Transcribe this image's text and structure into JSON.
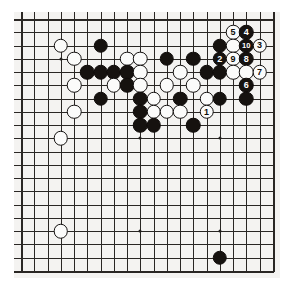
{
  "figure": {
    "kind": "go-board-diagram",
    "board_size_cols": 20,
    "board_size_rows": 20,
    "background_color": "#f4f3f1",
    "line_color": "#2a2724",
    "black_stone_color": "#16120f",
    "white_stone_color": "#fbfbfa"
  },
  "geometry": {
    "origin_x": 7,
    "origin_y": 7,
    "step": 13.25,
    "stone_diameter": 14.5,
    "label_font_size": 9
  },
  "star_points": [
    {
      "col": 3,
      "row": 3
    },
    {
      "col": 9,
      "row": 3
    },
    {
      "col": 15,
      "row": 3
    },
    {
      "col": 3,
      "row": 9
    },
    {
      "col": 9,
      "row": 9
    },
    {
      "col": 15,
      "row": 9
    },
    {
      "col": 3,
      "row": 16
    },
    {
      "col": 9,
      "row": 16
    },
    {
      "col": 15,
      "row": 16
    }
  ],
  "stones": [
    {
      "id": "w-c3r2",
      "color": "white",
      "col": 3,
      "row": 2,
      "label": ""
    },
    {
      "id": "b-c6r2",
      "color": "black",
      "col": 6,
      "row": 2,
      "label": ""
    },
    {
      "id": "w-c4r3",
      "color": "white",
      "col": 4,
      "row": 3,
      "label": ""
    },
    {
      "id": "w-c8r3",
      "color": "white",
      "col": 8,
      "row": 3,
      "label": ""
    },
    {
      "id": "w-c9r3",
      "color": "white",
      "col": 9,
      "row": 3,
      "label": ""
    },
    {
      "id": "b-c11r3",
      "color": "black",
      "col": 11,
      "row": 3,
      "label": ""
    },
    {
      "id": "b-c13r3",
      "color": "black",
      "col": 13,
      "row": 3,
      "label": ""
    },
    {
      "id": "b-c5r4",
      "color": "black",
      "col": 5,
      "row": 4,
      "label": ""
    },
    {
      "id": "b-c6r4",
      "color": "black",
      "col": 6,
      "row": 4,
      "label": ""
    },
    {
      "id": "b-c7r4",
      "color": "black",
      "col": 7,
      "row": 4,
      "label": ""
    },
    {
      "id": "b-c8r4",
      "color": "black",
      "col": 8,
      "row": 4,
      "label": ""
    },
    {
      "id": "w-c9r4",
      "color": "white",
      "col": 9,
      "row": 4,
      "label": ""
    },
    {
      "id": "w-c12r4",
      "color": "white",
      "col": 12,
      "row": 4,
      "label": ""
    },
    {
      "id": "b-c14r4",
      "color": "black",
      "col": 14,
      "row": 4,
      "label": ""
    },
    {
      "id": "b-c15r4",
      "color": "black",
      "col": 15,
      "row": 4,
      "label": ""
    },
    {
      "id": "w-c4r5",
      "color": "white",
      "col": 4,
      "row": 5,
      "label": ""
    },
    {
      "id": "w-c7r5",
      "color": "white",
      "col": 7,
      "row": 5,
      "label": ""
    },
    {
      "id": "b-c8r5",
      "color": "black",
      "col": 8,
      "row": 5,
      "label": ""
    },
    {
      "id": "w-c9r5",
      "color": "white",
      "col": 9,
      "row": 5,
      "label": ""
    },
    {
      "id": "w-c11r5",
      "color": "white",
      "col": 11,
      "row": 5,
      "label": ""
    },
    {
      "id": "w-c13r5",
      "color": "white",
      "col": 13,
      "row": 5,
      "label": ""
    },
    {
      "id": "b-c6r6",
      "color": "black",
      "col": 6,
      "row": 6,
      "label": ""
    },
    {
      "id": "b-c9r6",
      "color": "black",
      "col": 9,
      "row": 6,
      "label": ""
    },
    {
      "id": "w-c10r6",
      "color": "white",
      "col": 10,
      "row": 6,
      "label": ""
    },
    {
      "id": "b-c12r6",
      "color": "black",
      "col": 12,
      "row": 6,
      "label": ""
    },
    {
      "id": "w-c14r6",
      "color": "white",
      "col": 14,
      "row": 6,
      "label": ""
    },
    {
      "id": "b-c15r6",
      "color": "black",
      "col": 15,
      "row": 6,
      "label": ""
    },
    {
      "id": "w-c4r7",
      "color": "white",
      "col": 4,
      "row": 7,
      "label": ""
    },
    {
      "id": "b-c9r7",
      "color": "black",
      "col": 9,
      "row": 7,
      "label": ""
    },
    {
      "id": "w-c10r7",
      "color": "white",
      "col": 10,
      "row": 7,
      "label": ""
    },
    {
      "id": "w-c11r7",
      "color": "white",
      "col": 11,
      "row": 7,
      "label": ""
    },
    {
      "id": "w-c12r7",
      "color": "white",
      "col": 12,
      "row": 7,
      "label": ""
    },
    {
      "id": "w-c14r7",
      "color": "white",
      "col": 14,
      "row": 7,
      "label": "1"
    },
    {
      "id": "b-c9r8",
      "color": "black",
      "col": 9,
      "row": 8,
      "label": ""
    },
    {
      "id": "b-c10r8",
      "color": "black",
      "col": 10,
      "row": 8,
      "label": ""
    },
    {
      "id": "b-c13r8",
      "color": "black",
      "col": 13,
      "row": 8,
      "label": ""
    },
    {
      "id": "w-c3r9",
      "color": "white",
      "col": 3,
      "row": 9,
      "label": ""
    },
    {
      "id": "w-c16r1",
      "color": "white",
      "col": 16,
      "row": 1,
      "label": "5"
    },
    {
      "id": "b-c17r1",
      "color": "black",
      "col": 17,
      "row": 1,
      "label": "4"
    },
    {
      "id": "b-c15r2",
      "color": "black",
      "col": 15,
      "row": 2,
      "label": ""
    },
    {
      "id": "w-c16r2",
      "color": "white",
      "col": 16,
      "row": 2,
      "label": ""
    },
    {
      "id": "b-c17r2",
      "color": "black",
      "col": 17,
      "row": 2,
      "label": "10"
    },
    {
      "id": "w-c18r2",
      "color": "white",
      "col": 18,
      "row": 2,
      "label": "3"
    },
    {
      "id": "b-c15r3",
      "color": "black",
      "col": 15,
      "row": 3,
      "label": "2"
    },
    {
      "id": "w-c16r3",
      "color": "white",
      "col": 16,
      "row": 3,
      "label": "9"
    },
    {
      "id": "b-c17r3",
      "color": "black",
      "col": 17,
      "row": 3,
      "label": "8"
    },
    {
      "id": "w-c16r4b",
      "color": "white",
      "col": 16,
      "row": 4,
      "label": ""
    },
    {
      "id": "w-c17r4",
      "color": "white",
      "col": 17,
      "row": 4,
      "label": ""
    },
    {
      "id": "w-c18r4",
      "color": "white",
      "col": 18,
      "row": 4,
      "label": "7"
    },
    {
      "id": "b-c17r5",
      "color": "black",
      "col": 17,
      "row": 5,
      "label": "6"
    },
    {
      "id": "b-c17r6",
      "color": "black",
      "col": 17,
      "row": 6,
      "label": ""
    },
    {
      "id": "w-c3r16",
      "color": "white",
      "col": 3,
      "row": 16,
      "label": ""
    },
    {
      "id": "b-c15r18",
      "color": "black",
      "col": 15,
      "row": 18,
      "label": ""
    }
  ]
}
